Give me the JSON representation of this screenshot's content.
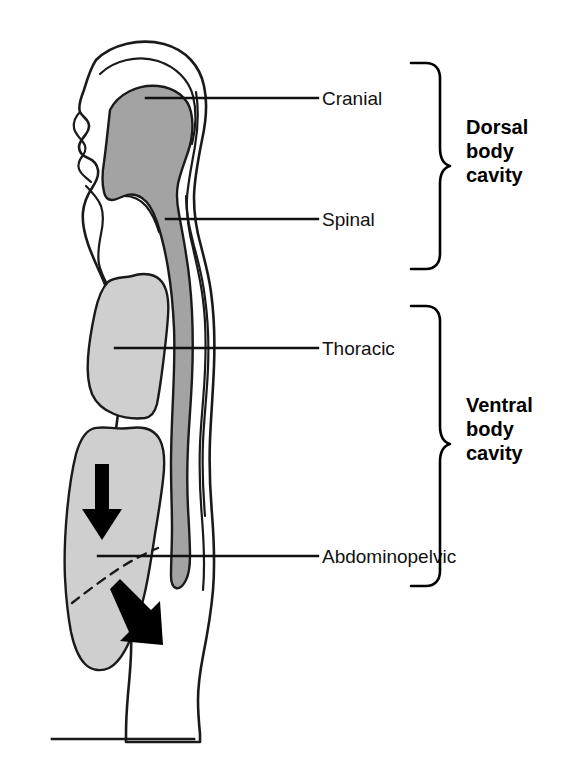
{
  "figure": {
    "type": "anatomical-diagram",
    "background_color": "#ffffff",
    "outline_color": "#1a1a1a",
    "dorsal_cavity_fill": "#a3a3a3",
    "ventral_cavity_fill": "#cfcfcf",
    "arrow_color": "#000000"
  },
  "labels": {
    "cranial": "Cranial",
    "spinal": "Spinal",
    "thoracic": "Thoracic",
    "abdominopelvic": "Abdominopelvic"
  },
  "braces": {
    "dorsal": {
      "line1": "Dorsal",
      "line2": "body",
      "line3": "cavity"
    },
    "ventral": {
      "line1": "Ventral",
      "line2": "body",
      "line3": "cavity"
    }
  },
  "caption": {
    "text": ""
  }
}
